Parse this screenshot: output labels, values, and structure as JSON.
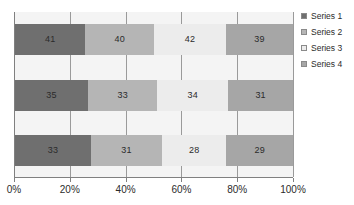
{
  "chart_data": {
    "type": "bar",
    "orientation": "horizontal",
    "stacked": "100%",
    "title": "",
    "xlabel": "",
    "ylabel": "",
    "grid": true,
    "legend_position": "right",
    "xlim": [
      0,
      100
    ],
    "xticks": [
      "0%",
      "20%",
      "40%",
      "60%",
      "80%",
      "100%"
    ],
    "xtick_values": [
      0,
      20,
      40,
      60,
      80,
      100
    ],
    "categories": [
      "Category 1",
      "Category 2",
      "Category 3"
    ],
    "series": [
      {
        "name": "Series 1",
        "color": "#6f6f6f",
        "values": [
          41,
          35,
          33
        ]
      },
      {
        "name": "Series 2",
        "color": "#b5b5b5",
        "values": [
          40,
          33,
          31
        ]
      },
      {
        "name": "Series 3",
        "color": "#ececec",
        "values": [
          42,
          34,
          28
        ]
      },
      {
        "name": "Series 4",
        "color": "#a6a6a6",
        "values": [
          39,
          31,
          29
        ]
      }
    ],
    "bar_rows": [
      {
        "row_index": 0,
        "total": 162,
        "segments": [
          {
            "series": "Series 1",
            "value": 41,
            "label": "41",
            "percent": 25.31,
            "color": "#6f6f6f"
          },
          {
            "series": "Series 2",
            "value": 40,
            "label": "40",
            "percent": 24.69,
            "color": "#b5b5b5"
          },
          {
            "series": "Series 3",
            "value": 42,
            "label": "42",
            "percent": 25.93,
            "color": "#ececec"
          },
          {
            "series": "Series 4",
            "value": 39,
            "label": "39",
            "percent": 24.07,
            "color": "#a6a6a6"
          }
        ]
      },
      {
        "row_index": 1,
        "total": 133,
        "segments": [
          {
            "series": "Series 1",
            "value": 35,
            "label": "35",
            "percent": 26.32,
            "color": "#6f6f6f"
          },
          {
            "series": "Series 2",
            "value": 33,
            "label": "33",
            "percent": 24.81,
            "color": "#b5b5b5"
          },
          {
            "series": "Series 3",
            "value": 34,
            "label": "34",
            "percent": 25.56,
            "color": "#ececec"
          },
          {
            "series": "Series 4",
            "value": 31,
            "label": "31",
            "percent": 23.31,
            "color": "#a6a6a6"
          }
        ]
      },
      {
        "row_index": 2,
        "total": 121,
        "segments": [
          {
            "series": "Series 1",
            "value": 33,
            "label": "33",
            "percent": 27.27,
            "color": "#6f6f6f"
          },
          {
            "series": "Series 2",
            "value": 31,
            "label": "31",
            "percent": 25.62,
            "color": "#b5b5b5"
          },
          {
            "series": "Series 3",
            "value": 28,
            "label": "28",
            "percent": 23.14,
            "color": "#ececec"
          },
          {
            "series": "Series 4",
            "value": 29,
            "label": "29",
            "percent": 23.97,
            "color": "#a6a6a6"
          }
        ]
      }
    ]
  },
  "legend": {
    "items": [
      {
        "label": "Series 1",
        "color": "#6f6f6f"
      },
      {
        "label": "Series 2",
        "color": "#b5b5b5"
      },
      {
        "label": "Series 3",
        "color": "#ececec"
      },
      {
        "label": "Series 4",
        "color": "#a6a6a6"
      }
    ]
  },
  "plot": {
    "background": "#f4f4f4",
    "axis_color": "#808080",
    "gridline_color": "#9a9a9a",
    "label_color": "#2b2b2b"
  }
}
